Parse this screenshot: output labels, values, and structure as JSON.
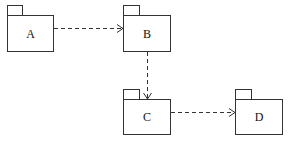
{
  "diagram": {
    "type": "uml-package-diagram",
    "packages": [
      {
        "id": "A",
        "label": "A"
      },
      {
        "id": "B",
        "label": "B"
      },
      {
        "id": "C",
        "label": "C"
      },
      {
        "id": "D",
        "label": "D"
      }
    ],
    "dependencies": [
      {
        "from": "A",
        "to": "B"
      },
      {
        "from": "B",
        "to": "C"
      },
      {
        "from": "C",
        "to": "D"
      }
    ]
  }
}
